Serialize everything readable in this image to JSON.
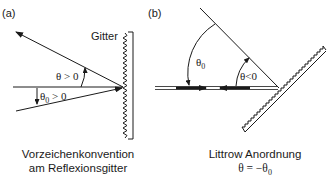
{
  "panel_a": {
    "label": "(a)",
    "grating_label": "Gitter",
    "theta_label": "θ > 0",
    "theta0_label": "θ",
    "theta0_sub": "0",
    "theta0_rest": " > 0",
    "caption_line1": "Vorzeichenkonvention",
    "caption_line2": "am Reflexionsgitter"
  },
  "panel_b": {
    "label": "(b)",
    "theta0_label": "θ",
    "theta0_sub": "0",
    "theta_label": "θ<0",
    "caption_line1": "Littrow Anordnung",
    "caption_line2_main": "θ = −θ",
    "caption_line2_sub": "0"
  }
}
